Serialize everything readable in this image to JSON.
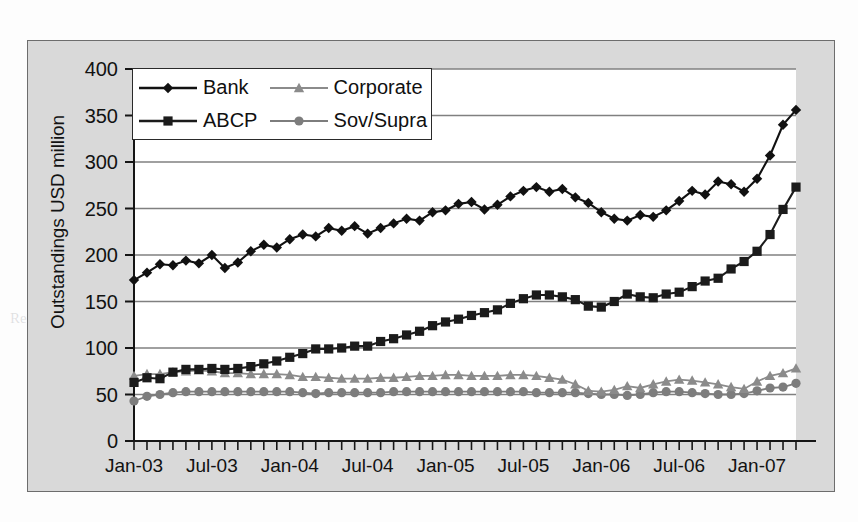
{
  "figure": {
    "background_color": "#d9d9d9",
    "plot_background_color": "#ffffff",
    "border_color": "#6d6d6d"
  },
  "page_bleed": [
    {
      "text": "structure may not attract... because they are",
      "x": 190,
      "y": 44,
      "big": false
    },
    {
      "text": "in the market and the corresponding",
      "x": 200,
      "y": 66,
      "big": false
    },
    {
      "text": "investor base for the opportunity",
      "x": 210,
      "y": 92,
      "big": false
    },
    {
      "text": "the high, they may be tempted by sponsor",
      "x": 215,
      "y": 120,
      "big": false
    },
    {
      "text": "Yield Curve",
      "x": 415,
      "y": 150,
      "big": true
    },
    {
      "text": "Shape of the yield curve is an influencing factor in investor",
      "x": 215,
      "y": 183,
      "big": false
    },
    {
      "text": "the return requirement versus refinancing risk",
      "x": 230,
      "y": 208,
      "big": false
    },
    {
      "text": "and drives the time term",
      "x": 245,
      "y": 232,
      "big": false
    },
    {
      "text": "SIV lites or hybrid structures",
      "x": 125,
      "y": 282,
      "big": false
    },
    {
      "text": "Repos and David abstained a going away with cases of management",
      "x": 10,
      "y": 310,
      "big": false
    }
  ],
  "chart_data": {
    "type": "line",
    "title": "",
    "xlabel": "",
    "ylabel": "Outstandings USD million",
    "ylim": [
      0,
      400
    ],
    "ytick_labels": [
      "0",
      "50",
      "100",
      "150",
      "200",
      "250",
      "300",
      "350",
      "400"
    ],
    "ytick_values": [
      0,
      50,
      100,
      150,
      200,
      250,
      300,
      350,
      400
    ],
    "grid": true,
    "legend_position": "upper-left-inside",
    "xtick_labels": [
      "Jan-03",
      "Jul-03",
      "Jan-04",
      "Jul-04",
      "Jan-05",
      "Jul-05",
      "Jan-06",
      "Jul-06",
      "Jan-07"
    ],
    "xtick_indices": [
      0,
      6,
      12,
      18,
      24,
      30,
      36,
      42,
      48
    ],
    "x_count": 52,
    "x_months": [
      "Jan-03",
      "Feb-03",
      "Mar-03",
      "Apr-03",
      "May-03",
      "Jun-03",
      "Jul-03",
      "Aug-03",
      "Sep-03",
      "Oct-03",
      "Nov-03",
      "Dec-03",
      "Jan-04",
      "Feb-04",
      "Mar-04",
      "Apr-04",
      "May-04",
      "Jun-04",
      "Jul-04",
      "Aug-04",
      "Sep-04",
      "Oct-04",
      "Nov-04",
      "Dec-04",
      "Jan-05",
      "Feb-05",
      "Mar-05",
      "Apr-05",
      "May-05",
      "Jun-05",
      "Jul-05",
      "Aug-05",
      "Sep-05",
      "Oct-05",
      "Nov-05",
      "Dec-05",
      "Jan-06",
      "Feb-06",
      "Mar-06",
      "Apr-06",
      "May-06",
      "Jun-06",
      "Jul-06",
      "Aug-06",
      "Sep-06",
      "Oct-06",
      "Nov-06",
      "Dec-06",
      "Jan-07",
      "Feb-07",
      "Mar-07",
      "Apr-07"
    ],
    "series": [
      {
        "name": "Bank",
        "marker": "diamond",
        "color": "#111111",
        "values": [
          173,
          181,
          190,
          189,
          194,
          191,
          200,
          186,
          192,
          204,
          211,
          208,
          217,
          222,
          220,
          229,
          226,
          231,
          223,
          229,
          234,
          239,
          237,
          246,
          248,
          255,
          257,
          249,
          254,
          263,
          269,
          273,
          268,
          271,
          262,
          256,
          246,
          239,
          237,
          243,
          241,
          248,
          258,
          269,
          265,
          279,
          276,
          268,
          282,
          307,
          340,
          356
        ]
      },
      {
        "name": "ABCP",
        "marker": "square",
        "color": "#1b1b1b",
        "values": [
          63,
          68,
          67,
          74,
          77,
          77,
          78,
          77,
          78,
          80,
          83,
          86,
          90,
          94,
          99,
          99,
          100,
          102,
          102,
          107,
          110,
          114,
          118,
          124,
          128,
          131,
          135,
          138,
          141,
          148,
          153,
          157,
          157,
          155,
          152,
          145,
          144,
          150,
          158,
          155,
          154,
          158,
          160,
          166,
          172,
          175,
          185,
          193,
          204,
          222,
          249,
          273
        ]
      },
      {
        "name": "Corporate",
        "marker": "triangle",
        "color": "#8b8b8b",
        "values": [
          70,
          72,
          72,
          74,
          75,
          76,
          75,
          73,
          73,
          72,
          72,
          72,
          71,
          69,
          69,
          68,
          67,
          67,
          67,
          68,
          68,
          69,
          70,
          70,
          71,
          71,
          70,
          70,
          70,
          71,
          71,
          70,
          68,
          66,
          61,
          54,
          53,
          55,
          59,
          57,
          61,
          64,
          66,
          65,
          63,
          61,
          58,
          56,
          64,
          70,
          73,
          78
        ]
      },
      {
        "name": "Sov/Supra",
        "marker": "circle",
        "color": "#7d7d7d",
        "values": [
          43,
          48,
          50,
          52,
          53,
          53,
          53,
          53,
          53,
          53,
          53,
          53,
          53,
          52,
          51,
          52,
          52,
          52,
          52,
          52,
          53,
          53,
          53,
          53,
          53,
          53,
          53,
          53,
          53,
          53,
          53,
          52,
          52,
          52,
          52,
          51,
          50,
          50,
          49,
          50,
          52,
          53,
          53,
          52,
          51,
          50,
          50,
          51,
          54,
          57,
          58,
          62
        ]
      }
    ]
  },
  "legend": {
    "entries": [
      {
        "label": "Bank",
        "marker": "diamond",
        "color": "#111111"
      },
      {
        "label": "Corporate",
        "marker": "triangle",
        "color": "#8b8b8b"
      },
      {
        "label": "ABCP",
        "marker": "square",
        "color": "#1b1b1b"
      },
      {
        "label": "Sov/Supra",
        "marker": "circle",
        "color": "#7d7d7d"
      }
    ]
  }
}
